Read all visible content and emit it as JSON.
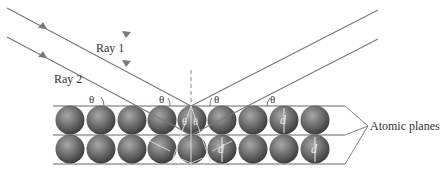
{
  "labels": {
    "ray1": "Ray 1",
    "ray2": "Ray 2",
    "atomic_planes": "Atomic planes",
    "theta": "θ",
    "spacing": "d"
  },
  "colors": {
    "ray": "#7a7a7a",
    "plane": "#666666",
    "sphere_dark": "#4a4a4a",
    "sphere_light": "#9a9a9a",
    "annotation": "#e8e8e8"
  },
  "layout": {
    "planes_y": [
      106,
      135,
      164
    ],
    "planes_x": [
      53,
      345
    ],
    "reflection_point": [
      191,
      106
    ],
    "sphere_count_per_row": 9
  }
}
